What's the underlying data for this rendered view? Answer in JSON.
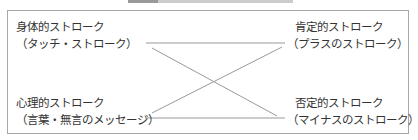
{
  "title": "",
  "diagram": {
    "nodes": [
      {
        "id": "physical",
        "line1": "身体的ストローク",
        "line2": "（タッチ・ストローク）"
      },
      {
        "id": "psychological",
        "line1": "心理的ストローク",
        "line2": "（言葉・無言のメッセージ）"
      },
      {
        "id": "positive",
        "line1": "肯定的ストローク",
        "line2": "（プラスのストローク）"
      },
      {
        "id": "negative",
        "line1": "否定的ストローク",
        "line2": "（マイナスのストローク）"
      }
    ],
    "edges": [
      {
        "from": "physical",
        "to": "positive"
      },
      {
        "from": "physical",
        "to": "negative"
      },
      {
        "from": "psychological",
        "to": "positive"
      },
      {
        "from": "psychological",
        "to": "negative"
      }
    ],
    "line_color": "#999999",
    "border_color": "#a8a8a8"
  }
}
